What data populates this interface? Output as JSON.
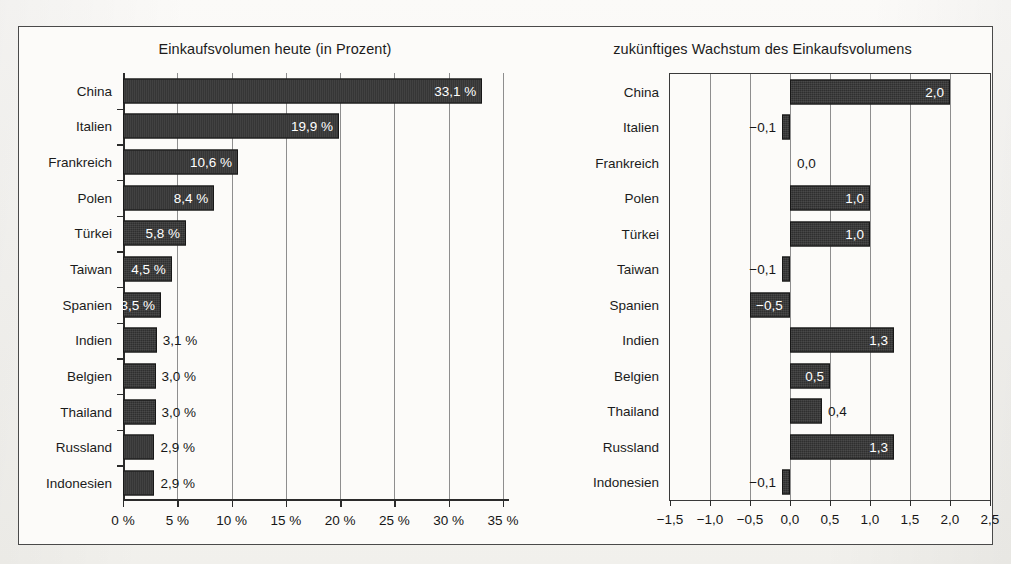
{
  "chart_data": [
    {
      "type": "bar",
      "orientation": "horizontal",
      "title": "Einkaufsvolumen heute (in Prozent)",
      "xlabel": "",
      "ylabel": "",
      "xlim": [
        0,
        35
      ],
      "grid": true,
      "legend": "none",
      "tick_labels": [
        "0 %",
        "5 %",
        "10 %",
        "15 %",
        "20 %",
        "25 %",
        "30 %",
        "35 %"
      ],
      "ticks": [
        0,
        5,
        10,
        15,
        20,
        25,
        30,
        35
      ],
      "categories": [
        "China",
        "Italien",
        "Frankreich",
        "Polen",
        "Türkei",
        "Taiwan",
        "Spanien",
        "Indien",
        "Belgien",
        "Thailand",
        "Russland",
        "Indonesien"
      ],
      "values": [
        33.1,
        19.9,
        10.6,
        8.4,
        5.8,
        4.5,
        3.5,
        3.1,
        3.0,
        3.0,
        2.9,
        2.9
      ],
      "data_labels": [
        "33,1 %",
        "19,9 %",
        "10,6 %",
        "8,4 %",
        "5,8 %",
        "4,5 %",
        "3,5 %",
        "3,1 %",
        "3,0 %",
        "3,0 %",
        "2,9 %",
        "2,9 %"
      ]
    },
    {
      "type": "bar",
      "orientation": "horizontal",
      "title": "zukünftiges Wachstum des Einkaufsvolumens",
      "xlabel": "",
      "ylabel": "",
      "xlim": [
        -1.5,
        2.5
      ],
      "grid": true,
      "legend": "none",
      "tick_labels": [
        "−1,5",
        "−1,0",
        "−0,5",
        "0,0",
        "0,5",
        "1,0",
        "1,5",
        "2,0",
        "2,5"
      ],
      "ticks": [
        -1.5,
        -1.0,
        -0.5,
        0.0,
        0.5,
        1.0,
        1.5,
        2.0,
        2.5
      ],
      "categories": [
        "China",
        "Italien",
        "Frankreich",
        "Polen",
        "Türkei",
        "Taiwan",
        "Spanien",
        "Indien",
        "Belgien",
        "Thailand",
        "Russland",
        "Indonesien"
      ],
      "values": [
        2.0,
        -0.1,
        0.0,
        1.0,
        1.0,
        -0.1,
        -0.5,
        1.3,
        0.5,
        0.4,
        1.3,
        -0.1
      ],
      "data_labels": [
        "2,0",
        "−0,1",
        "0,0",
        "1,0",
        "1,0",
        "−0,1",
        "−0,5",
        "1,3",
        "0,5",
        "0,4",
        "1,3",
        "−0,1"
      ]
    }
  ],
  "colors": {
    "bar_fill": "#2f2f2f",
    "bar_stroke": "#171717",
    "axis": "#2b2b2b",
    "grid": "#8e8e8e",
    "text": "#1b1b1b",
    "page_background": "#f4f3f0",
    "frame_background": "#fcfbf9"
  }
}
